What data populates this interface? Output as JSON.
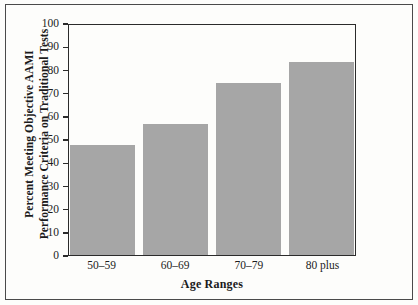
{
  "chart_data": {
    "type": "bar",
    "title": "",
    "subtitle": "",
    "categories": [
      "50–59",
      "60–69",
      "70–79",
      "80 plus"
    ],
    "values": [
      48,
      57,
      75,
      84
    ],
    "series": [
      {
        "name": "Percent Meeting Objective AAMI Performance Criteria on Traditional Tests",
        "values": [
          48,
          57,
          75,
          84
        ]
      }
    ],
    "xlabel": "Age Ranges",
    "ylabel": "Percent Meeting Objective AAMI Performance Criteria on Traditional Tests",
    "ylabel_line1": "Percent Meeting Objective AAMI",
    "ylabel_line2": "Performance Criteria on Traditional Tests",
    "ylim": [
      0,
      100
    ],
    "yticks": [
      100,
      90,
      80,
      70,
      60,
      50,
      40,
      30,
      20,
      10,
      0
    ],
    "ytick_labels": [
      "100",
      "90",
      "80",
      "70",
      "60",
      "50",
      "40",
      "30",
      "20",
      "10",
      "0"
    ],
    "grid": false,
    "legend": false,
    "legend_position": "none",
    "bar_color": "#a6a6a6",
    "axis_color": "#2b2b2b",
    "background_color": "#fdfdfb"
  },
  "axes": {
    "y_title_line1": "Percent Meeting Objective AAMI",
    "y_title_line2": "Performance Criteria on Traditional Tests",
    "x_title": "Age Ranges"
  },
  "ticks": {
    "y": [
      "100",
      "90",
      "80",
      "70",
      "60",
      "50",
      "40",
      "30",
      "20",
      "10",
      "0"
    ],
    "x": [
      "50–59",
      "60–69",
      "70–79",
      "80 plus"
    ]
  }
}
